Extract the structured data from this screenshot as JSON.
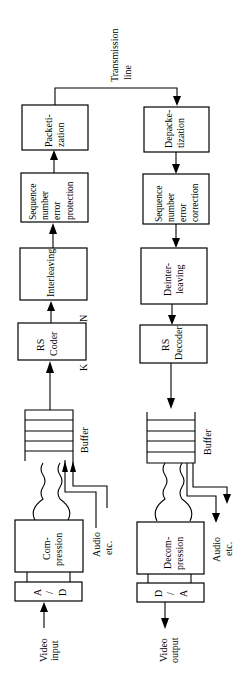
{
  "diagram": {
    "type": "block-diagram",
    "orientation": "rotated-90-ccw",
    "transmission_line": {
      "line1": "Transmission",
      "line2": "line"
    },
    "transmitter": {
      "input": {
        "line1": "Video",
        "line2": "input"
      },
      "ad": {
        "a": "A",
        "slash": "/",
        "d": "D"
      },
      "compression": {
        "line1": "Com-",
        "line2": "pression"
      },
      "audio": {
        "line1": "Audio",
        "line2": "etc."
      },
      "buffer": "Buffer",
      "rs_coder": {
        "line1": "RS",
        "line2": "Coder",
        "k": "K",
        "n": "N"
      },
      "interleaving": "Interleaving",
      "sequence": {
        "line1": "Sequence",
        "line2": "number",
        "line3": "error",
        "line4": "protection"
      },
      "packetization": {
        "line1": "Packeti-",
        "line2": "zation"
      }
    },
    "receiver": {
      "depacketization": {
        "line1": "Depacke-",
        "line2": "tization"
      },
      "sequence": {
        "line1": "Sequence",
        "line2": "number",
        "line3": "error",
        "line4": "correction"
      },
      "deinterleaving": {
        "line1": "Deinter-",
        "line2": "leaving"
      },
      "rs_decoder": {
        "line1": "RS",
        "line2": "Decoder"
      },
      "buffer": "Buffer",
      "decompression": {
        "line1": "Decom-",
        "line2": "pression"
      },
      "audio": {
        "line1": "Audio",
        "line2": "etc."
      },
      "da": {
        "d": "D",
        "slash": "/",
        "a": "A"
      },
      "output": {
        "line1": "Video",
        "line2": "output"
      }
    }
  }
}
